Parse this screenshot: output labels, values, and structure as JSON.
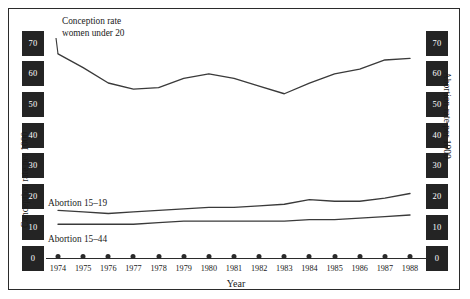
{
  "axes": {
    "left": {
      "title": "Conception rate per 1000",
      "ticks": [
        "70",
        "60",
        "50",
        "40",
        "30",
        "20",
        "10",
        "0"
      ]
    },
    "right": {
      "title": "Abortion rate per 1000",
      "ticks": [
        "70",
        "60",
        "50",
        "40",
        "30",
        "20",
        "10",
        "0"
      ]
    },
    "x": {
      "title": "Year",
      "ticks": [
        "1974",
        "1975",
        "1976",
        "1977",
        "1978",
        "1979",
        "1980",
        "1981",
        "1982",
        "1983",
        "1984",
        "1985",
        "1986",
        "1987",
        "1988"
      ]
    }
  },
  "annotations": {
    "conception_line1": "Conception rate",
    "conception_line2": "women under 20",
    "abortion_15_19": "Abortion 15–19",
    "abortion_15_44": "Abortion 15–44"
  },
  "colors": {
    "line": "#3a3a3a",
    "axis_band": "#242424",
    "axis_band_text": "#ffffff",
    "frame": "#2b2b2b",
    "background": "#ffffff"
  },
  "chart_data": {
    "type": "line",
    "title": "",
    "xlabel": "Year",
    "ylabel": "Conception rate per 1000",
    "y2label": "Abortion rate per 1000",
    "x": [
      1974,
      1975,
      1976,
      1977,
      1978,
      1979,
      1980,
      1981,
      1982,
      1983,
      1984,
      1985,
      1986,
      1987,
      1988
    ],
    "ylim": [
      0,
      75
    ],
    "y2lim": [
      0,
      75
    ],
    "grid": false,
    "legend": "inline-annotations",
    "series": [
      {
        "name": "Conception rate women under 20",
        "axis": "left",
        "values": [
          66.5,
          62.0,
          57.0,
          55.0,
          55.5,
          58.5,
          60.0,
          58.5,
          56.0,
          53.5,
          57.0,
          60.0,
          61.5,
          64.5,
          65.0
        ]
      },
      {
        "name": "Abortion 15–19",
        "axis": "right",
        "values": [
          15.5,
          15.0,
          14.5,
          15.0,
          15.5,
          16.0,
          16.5,
          16.5,
          17.0,
          17.5,
          19.0,
          18.5,
          18.5,
          19.5,
          21.0
        ]
      },
      {
        "name": "Abortion 15–44",
        "axis": "right",
        "values": [
          11.0,
          11.0,
          11.0,
          11.0,
          11.5,
          12.0,
          12.0,
          12.0,
          12.0,
          12.0,
          12.5,
          12.5,
          13.0,
          13.5,
          14.0
        ]
      }
    ]
  }
}
